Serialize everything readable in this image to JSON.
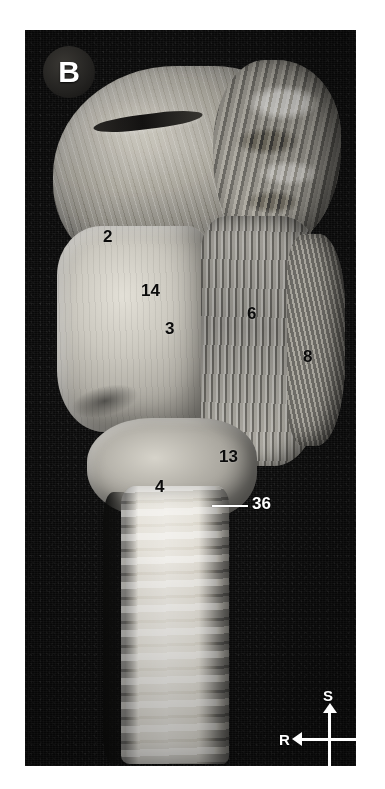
{
  "figure": {
    "panel_label": "B",
    "kind": "anatomical-dissection-photograph"
  },
  "labels": [
    {
      "id": "label-2",
      "text": "2",
      "x": 103,
      "y": 228,
      "tone": "dark"
    },
    {
      "id": "label-14",
      "text": "14",
      "x": 141,
      "y": 282,
      "tone": "dark"
    },
    {
      "id": "label-3",
      "text": "3",
      "x": 165,
      "y": 320,
      "tone": "dark"
    },
    {
      "id": "label-6",
      "text": "6",
      "x": 247,
      "y": 305,
      "tone": "dark"
    },
    {
      "id": "label-8",
      "text": "8",
      "x": 303,
      "y": 348,
      "tone": "dark"
    },
    {
      "id": "label-13",
      "text": "13",
      "x": 219,
      "y": 448,
      "tone": "dark"
    },
    {
      "id": "label-4",
      "text": "4",
      "x": 155,
      "y": 478,
      "tone": "dark"
    },
    {
      "id": "label-36",
      "text": "36",
      "x": 252,
      "y": 495,
      "tone": "light"
    }
  ],
  "leader": {
    "name": "leader-line-36",
    "x": 212,
    "y": 505,
    "length": 36
  },
  "compass": {
    "superior": "S",
    "inferior": "I",
    "right": "R",
    "left": "L"
  },
  "colors": {
    "background": "#ffffff",
    "plate_background": "#0a0a0a",
    "label_dark": "#0b0b0b",
    "label_light": "#ffffff",
    "badge_background": "#232220",
    "compass_stroke": "#ffffff"
  }
}
